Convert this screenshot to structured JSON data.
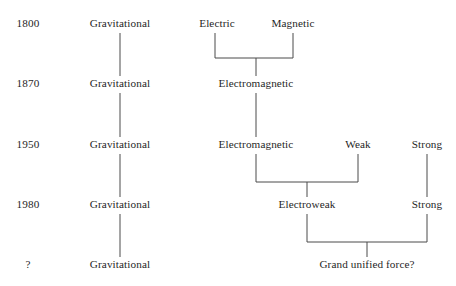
{
  "diagram": {
    "type": "tree-timeline",
    "background_color": "#ffffff",
    "line_color": "#4a4a4a",
    "text_color": "#1f1f1f",
    "rows": [
      {
        "year": "1800",
        "year_x": 28,
        "baseline_y": 27,
        "nodes": [
          {
            "label": "Gravitational",
            "x": 120
          },
          {
            "label": "Electric",
            "x": 217
          },
          {
            "label": "Magnetic",
            "x": 293
          }
        ]
      },
      {
        "year": "1870",
        "year_x": 28,
        "baseline_y": 87,
        "nodes": [
          {
            "label": "Gravitational",
            "x": 120
          },
          {
            "label": "Electromagnetic",
            "x": 256
          }
        ]
      },
      {
        "year": "1950",
        "year_x": 28,
        "baseline_y": 148,
        "nodes": [
          {
            "label": "Gravitational",
            "x": 120
          },
          {
            "label": "Electromagnetic",
            "x": 256
          },
          {
            "label": "Weak",
            "x": 358
          },
          {
            "label": "Strong",
            "x": 427
          }
        ]
      },
      {
        "year": "1980",
        "year_x": 28,
        "baseline_y": 208,
        "nodes": [
          {
            "label": "Gravitational",
            "x": 120
          },
          {
            "label": "Electroweak",
            "x": 307
          },
          {
            "label": "Strong",
            "x": 427
          }
        ]
      },
      {
        "year": "?",
        "year_x": 28,
        "baseline_y": 268,
        "nodes": [
          {
            "label": "Gravitational",
            "x": 120
          },
          {
            "label": "Grand unified force?",
            "x": 367
          }
        ]
      }
    ],
    "connectors": {
      "gravitational_lines": [
        {
          "x": 120,
          "y1": 33,
          "y2": 76
        },
        {
          "x": 120,
          "y1": 93,
          "y2": 137
        },
        {
          "x": 120,
          "y1": 154,
          "y2": 197
        },
        {
          "x": 120,
          "y1": 214,
          "y2": 257
        }
      ],
      "brackets": [
        {
          "name": "electric-magnetic-to-electromagnetic",
          "left_x": 215,
          "right_x": 293,
          "top_y": 33,
          "bar_y": 58,
          "stub_x": 256,
          "stub_y2": 76
        },
        {
          "name": "electromagnetic-weak-to-electroweak",
          "left_x": 256,
          "right_x": 358,
          "top_y": 154,
          "bar_y": 182,
          "stub_x": 307,
          "stub_y2": 197
        },
        {
          "name": "electroweak-strong-to-grand-unified",
          "left_x": 307,
          "right_x": 427,
          "top_y": 214,
          "bar_y": 242,
          "stub_x": 367,
          "stub_y2": 257
        }
      ],
      "straight_lines": [
        {
          "name": "electromagnetic-1870-to-1950",
          "x": 256,
          "y1": 93,
          "y2": 137
        },
        {
          "name": "strong-1950-to-1980",
          "x": 427,
          "y1": 154,
          "y2": 197
        }
      ]
    }
  }
}
